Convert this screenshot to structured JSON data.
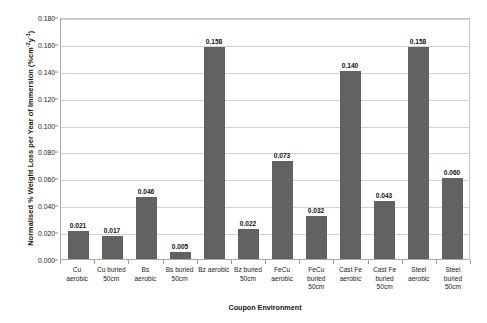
{
  "chart_data": {
    "type": "bar",
    "title": "",
    "xlabel": "Coupon Environment",
    "ylabel": "Normalised % Weight Loss per Year of Immersion (%cm",
    "ylabel_sup1": "-2",
    "ylabel_mid": "y",
    "ylabel_sup2": "-1",
    "ylabel_end": ")",
    "categories": [
      "Cu aerobic",
      "Cu buried 50cm",
      "Bs aerobic",
      "Bs buried 50cm",
      "Bz aerobic",
      "Bz buried 50cm",
      "FeCu aerobic",
      "FeCu buried 50cm",
      "Cast Fe aerobic",
      "Cast Fe buried 50cm",
      "Steel aerobic",
      "Steel buried 50cm"
    ],
    "category_lines": [
      [
        "Cu",
        "aerobic"
      ],
      [
        "Cu buried",
        "50cm"
      ],
      [
        "Bs",
        "aerobic"
      ],
      [
        "Bs buried",
        "50cm"
      ],
      [
        "Bz aerobic"
      ],
      [
        "Bz buried",
        "50cm"
      ],
      [
        "FeCu",
        "aerobic"
      ],
      [
        "FeCu",
        "buried",
        "50cm"
      ],
      [
        "Cast Fe",
        "aerobic"
      ],
      [
        "Cast Fe",
        "buried",
        "50cm"
      ],
      [
        "Steel",
        "aerobic"
      ],
      [
        "Steel",
        "buried",
        "50cm"
      ]
    ],
    "values": [
      0.021,
      0.017,
      0.046,
      0.005,
      0.158,
      0.022,
      0.073,
      0.032,
      0.14,
      0.043,
      0.158,
      0.06
    ],
    "value_labels": [
      "0.021",
      "0.017",
      "0.046",
      "0.005",
      "0.158",
      "0.022",
      "0.073",
      "0.032",
      "0.140",
      "0.043",
      "0.158",
      "0.060"
    ],
    "ylim": [
      0.0,
      0.18
    ],
    "ytick_labels": [
      "0.180",
      "0.160",
      "0.140",
      "0.120",
      "0.100",
      "0.080",
      "0.060",
      "0.040",
      "0.020",
      "0.000"
    ],
    "ytick_values": [
      0.18,
      0.16,
      0.14,
      0.12,
      0.1,
      0.08,
      0.06,
      0.04,
      0.02,
      0.0
    ],
    "grid": true,
    "legend": "none",
    "bar_color": "#626262",
    "grid_color": "#d2d2d2",
    "axis_color": "#a9a9a9"
  }
}
